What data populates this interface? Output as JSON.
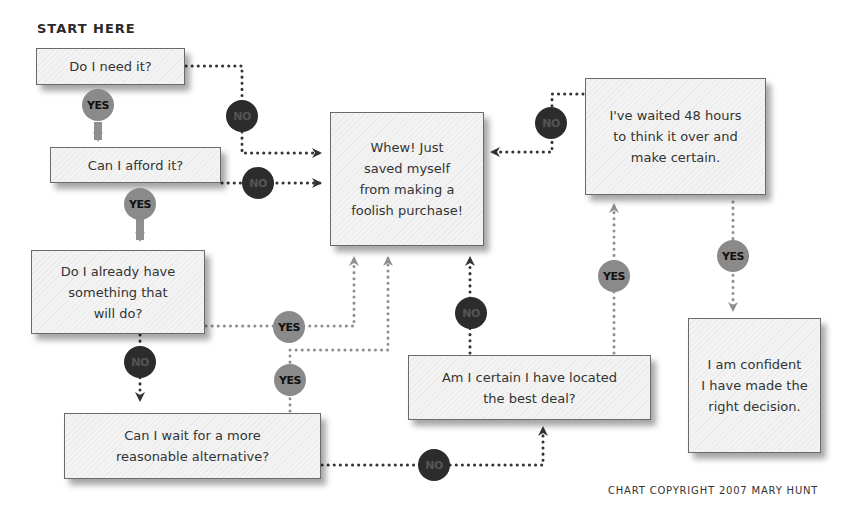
{
  "title": "START HERE",
  "nodes": {
    "need": "Do I need it?",
    "afford": "Can I afford it?",
    "already_have": "Do I already have\nsomething that\nwill do?",
    "wait": "Can I wait for a more\nreasonable alternative?",
    "whew": "Whew! Just\nsaved myself\nfrom making a\nfoolish purchase!",
    "waited": "I've waited 48 hours\nto think it over and\nmake certain.",
    "best_deal": "Am I certain I have located\nthe best deal?",
    "confident": "I am confident\nI have made the\nright decision."
  },
  "labels": {
    "yes": "YES",
    "no": "NO"
  },
  "copyright": "CHART COPYRIGHT 2007 MARY HUNT",
  "colors": {
    "yes_badge": "#8a8a8a",
    "no_badge": "#2c2c2c",
    "yes_line": "#8f8f8f",
    "no_line": "#333333",
    "box_border": "#6a6a6a"
  }
}
